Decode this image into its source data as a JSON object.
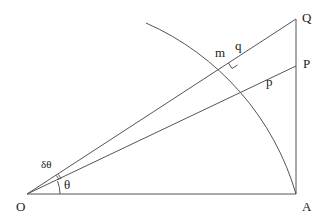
{
  "diagram": {
    "type": "geometry",
    "line_color": "#555555",
    "text_color": "#222222",
    "points": {
      "O": {
        "label": "O",
        "x": 27,
        "y": 194
      },
      "A": {
        "label": "A",
        "x": 296,
        "y": 194
      },
      "Q": {
        "label": "Q",
        "x": 296,
        "y": 19
      },
      "P": {
        "label": "P",
        "x": 296,
        "y": 66
      },
      "m": {
        "label": "m"
      },
      "q": {
        "label": "q"
      },
      "p": {
        "label": "p"
      }
    },
    "angles": {
      "theta": "θ",
      "dtheta": "δθ"
    }
  }
}
